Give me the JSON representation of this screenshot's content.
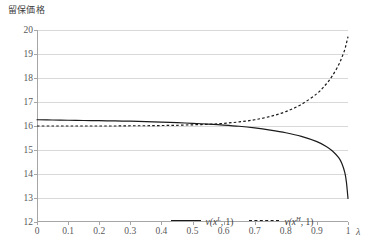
{
  "chart_data": {
    "type": "line",
    "title": "",
    "ylabel": "留保価格",
    "xlabel": "λ",
    "xlim": [
      0,
      1
    ],
    "ylim": [
      12,
      20
    ],
    "grid": true,
    "legend_position": "bottom-center-inside",
    "x_ticks": [
      "0",
      "0.1",
      "0.2",
      "0.3",
      "0.4",
      "0.5",
      "0.6",
      "0.7",
      "0.8",
      "0.9",
      "1"
    ],
    "y_ticks": [
      "12",
      "13",
      "14",
      "15",
      "16",
      "17",
      "18",
      "19",
      "20"
    ],
    "x": [
      0,
      0.05,
      0.1,
      0.15,
      0.2,
      0.25,
      0.3,
      0.35,
      0.4,
      0.45,
      0.5,
      0.55,
      0.6,
      0.65,
      0.7,
      0.75,
      0.8,
      0.85,
      0.9,
      0.93,
      0.95,
      0.97,
      0.98,
      0.99,
      0.995,
      1
    ],
    "series": [
      {
        "name": "v(x^L, 1)",
        "style": "solid",
        "color": "#1a1a1a",
        "values": [
          16.26,
          16.25,
          16.24,
          16.23,
          16.22,
          16.21,
          16.2,
          16.18,
          16.16,
          16.14,
          16.11,
          16.08,
          16.04,
          15.99,
          15.92,
          15.83,
          15.72,
          15.57,
          15.35,
          15.15,
          14.96,
          14.68,
          14.45,
          14.05,
          13.65,
          12.98
        ]
      },
      {
        "name": "v(x^H, 1)",
        "style": "dashed",
        "color": "#1a1a1a",
        "values": [
          16.0,
          16.0,
          16.0,
          16.0,
          16.0,
          16.0,
          16.01,
          16.01,
          16.02,
          16.03,
          16.05,
          16.07,
          16.11,
          16.17,
          16.26,
          16.4,
          16.6,
          16.9,
          17.35,
          17.75,
          18.1,
          18.55,
          18.85,
          19.2,
          19.45,
          19.72
        ]
      }
    ]
  },
  "legend": {
    "entries": [
      {
        "prefix": "v(x",
        "sup": "L",
        "suffix": ", 1)",
        "style": "solid"
      },
      {
        "prefix": "v(x",
        "sup": "H",
        "suffix": ", 1)",
        "style": "dashed"
      }
    ]
  }
}
